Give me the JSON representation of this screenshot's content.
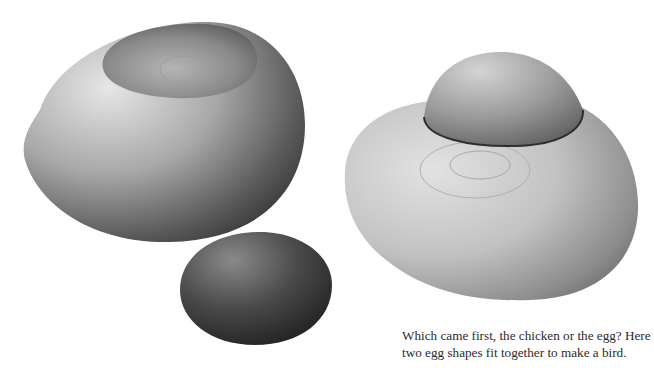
{
  "figure": {
    "objects": [
      {
        "name": "hollow-egg-bowl",
        "description": "large pale wooden egg with a shallow hollow on top"
      },
      {
        "name": "small-egg",
        "description": "small dark wooden egg"
      },
      {
        "name": "bird-form",
        "description": "large wooden base with a smaller egg-shaped head fitted on top"
      }
    ],
    "colors": {
      "background": "#ffffff",
      "wood_light": "#d8d8d8",
      "wood_dark": "#2e2e2e"
    }
  },
  "caption": {
    "text": "Which came first, the chicken or the egg? Here two egg shapes fit together to make a bird."
  }
}
